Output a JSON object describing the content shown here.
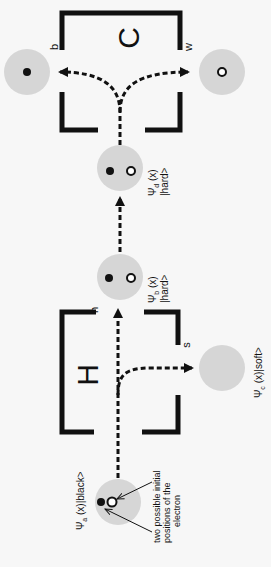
{
  "diagram": {
    "orientation": "rotated-90-ccw",
    "colors": {
      "background": "#f7f7f7",
      "circle_fill": "#d6d6d6",
      "ink": "#111111"
    },
    "boxes": {
      "hardness": {
        "letter": "H",
        "port_hard": "h",
        "port_soft": "s"
      },
      "color": {
        "letter": "C",
        "port_black": "b",
        "port_white": "w"
      }
    },
    "states": {
      "a": {
        "label": "Ψa (x)|black>",
        "psi": "Ψ",
        "sub": "a",
        "rest": " (x)|black>"
      },
      "b": {
        "label": "Ψb (x) |hard>",
        "psi": "Ψ",
        "sub": "b",
        "line1_rest": " (x)",
        "line2": "|hard>"
      },
      "c": {
        "label": "Ψc (x)|soft>",
        "psi": "Ψ",
        "sub": "c",
        "rest": " (x)|soft>"
      },
      "d": {
        "label": "Ψd (x) |hard>",
        "psi": "Ψ",
        "sub": "d",
        "line1_rest": " (x)",
        "line2": "|hard>"
      }
    },
    "annotation": {
      "line1": "two possible initial",
      "line2": "positions of the",
      "line3": "electron"
    }
  }
}
